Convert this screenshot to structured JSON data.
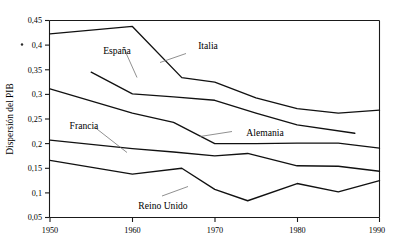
{
  "chart_data": {
    "type": "line",
    "title": "",
    "subtitle": "",
    "xlabel": "",
    "ylabel": "Dispersión del PIB",
    "xlim": [
      1950,
      1990
    ],
    "ylim": [
      0.05,
      0.45
    ],
    "grid": false,
    "legend_position": "inline-labels",
    "x_ticks": [
      "1950",
      "1960",
      "1970",
      "1980",
      "1990"
    ],
    "x_tick_values": [
      1950,
      1960,
      1970,
      1980,
      1990
    ],
    "y_ticks": [
      "0,45",
      "0,4",
      "0,35",
      "0,3",
      "0,25",
      "0,2",
      "0,15",
      "0,1",
      "0,05"
    ],
    "y_tick_values": [
      0.45,
      0.4,
      0.35,
      0.3,
      0.25,
      0.2,
      0.15,
      0.1,
      0.05
    ],
    "series": [
      {
        "name": "Italia",
        "x": [
          1950,
          1960,
          1966,
          1970,
          1975,
          1980,
          1985,
          1990
        ],
        "values": [
          0.423,
          0.438,
          0.334,
          0.325,
          0.293,
          0.271,
          0.262,
          0.268
        ]
      },
      {
        "name": "España",
        "x": [
          1955,
          1960,
          1965,
          1970,
          1975,
          1980,
          1987
        ],
        "values": [
          0.345,
          0.301,
          0.295,
          0.288,
          0.262,
          0.238,
          0.221
        ]
      },
      {
        "name": "Alemania",
        "x": [
          1950,
          1960,
          1965,
          1970,
          1975,
          1980,
          1985,
          1990
        ],
        "values": [
          0.311,
          0.262,
          0.243,
          0.2,
          0.2,
          0.201,
          0.201,
          0.191
        ]
      },
      {
        "name": "Francia",
        "x": [
          1950,
          1960,
          1965,
          1970,
          1974,
          1980,
          1985,
          1990
        ],
        "values": [
          0.207,
          0.19,
          0.183,
          0.175,
          0.18,
          0.155,
          0.154,
          0.144
        ]
      },
      {
        "name": "Reino Unido",
        "x": [
          1950,
          1960,
          1966,
          1970,
          1974,
          1980,
          1985,
          1990
        ],
        "values": [
          0.166,
          0.138,
          0.15,
          0.107,
          0.084,
          0.119,
          0.102,
          0.125
        ]
      }
    ],
    "annotations": [
      {
        "text": "Italia",
        "x": 1970,
        "y": 0.404
      },
      {
        "text": "España",
        "x": 1957,
        "y": 0.392
      },
      {
        "text": "Alemania",
        "x": 1979,
        "y": 0.234
      },
      {
        "text": "Francia",
        "x": 1954,
        "y": 0.245
      },
      {
        "text": "Reino Unido",
        "x": 1964,
        "y": 0.078
      }
    ]
  },
  "chart": {
    "ylabel": "Dispersión del PIB",
    "y_tick_0": "0,45",
    "y_tick_1": "0,4",
    "y_tick_2": "0,35",
    "y_tick_3": "0,3",
    "y_tick_4": "0,25",
    "y_tick_5": "0,2",
    "y_tick_6": "0,15",
    "y_tick_7": "0,1",
    "y_tick_8": "0,05",
    "x_tick_0": "1950",
    "x_tick_1": "1960",
    "x_tick_2": "1970",
    "x_tick_3": "1980",
    "x_tick_4": "1990",
    "label_italia": "Italia",
    "label_espana": "España",
    "label_alemania": "Alemania",
    "label_francia": "Francia",
    "label_reino_unido": "Reino Unido"
  },
  "colors": {
    "line": "#111111",
    "axis": "#1a1a1a",
    "leader": "#6b6b6b",
    "background": "#ffffff"
  }
}
